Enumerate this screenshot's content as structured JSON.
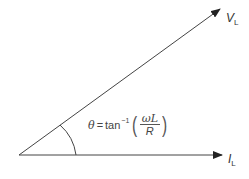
{
  "diagram": {
    "type": "phasor-diagram",
    "colors": {
      "line": "#333333",
      "text": "#333333",
      "background": "#ffffff"
    },
    "phasors": [
      {
        "name": "V_L",
        "label_main": "V",
        "label_sub": "L",
        "from": [
          19,
          155
        ],
        "to": [
          220,
          9
        ]
      },
      {
        "name": "I_L",
        "label_main": "I",
        "label_sub": "L",
        "from": [
          19,
          155
        ],
        "to": [
          222,
          155
        ]
      }
    ],
    "angle": {
      "symbol": "θ",
      "equals": "=",
      "function": "tan",
      "exponent": "−1",
      "numerator": "ωL",
      "denominator": "R",
      "open_paren": "(",
      "close_paren": ")"
    }
  }
}
